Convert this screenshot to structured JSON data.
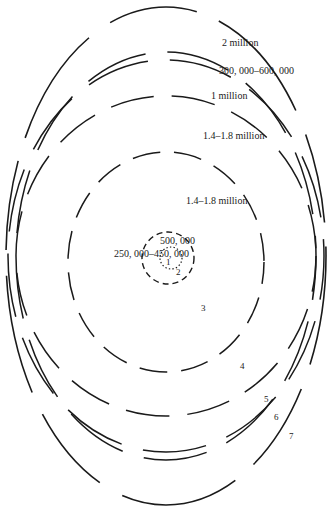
{
  "diagram": {
    "type": "concentric-zone-diagram",
    "caption_partial": "",
    "rings": [
      {
        "zone": "1",
        "style": "dotted"
      },
      {
        "zone": "2",
        "style": "dashed"
      },
      {
        "zone": "3",
        "style": "long-dash"
      },
      {
        "zone": "4",
        "style": "long-dash"
      },
      {
        "zone": "5",
        "style": "double-line"
      },
      {
        "zone": "6",
        "style": "double-line"
      },
      {
        "zone": "7",
        "style": "solid-broken"
      }
    ],
    "value_labels": [
      {
        "id": "outer",
        "text": "2 million"
      },
      {
        "id": "double",
        "text": "300, 000–600, 000"
      },
      {
        "id": "ring4",
        "text": "1 million"
      },
      {
        "id": "zone4",
        "text": "1.4–1.8 million"
      },
      {
        "id": "zone3",
        "text": "1.4–1.8 million"
      },
      {
        "id": "ring2",
        "text": "500, 000"
      },
      {
        "id": "ring1",
        "text": "250, 000–450, 000"
      }
    ],
    "zone_numbers": [
      "1",
      "2",
      "3",
      "4",
      "5",
      "6",
      "7"
    ]
  }
}
